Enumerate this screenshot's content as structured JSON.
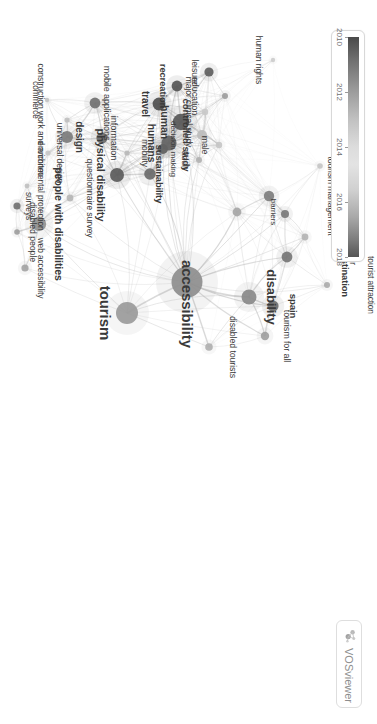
{
  "app": {
    "name": "VOSviewer",
    "brand_label": "VOSviewer",
    "canvas_background": "#ffffff"
  },
  "legend": {
    "type": "continuous-color-scale",
    "variable": "avg. publication year",
    "min": 2010,
    "max": 2018,
    "ticks": [
      {
        "label": "2010",
        "value": 2010
      },
      {
        "label": "2012",
        "value": 2012
      },
      {
        "label": "2014",
        "value": 2014
      },
      {
        "label": "2016",
        "value": 2016
      },
      {
        "label": "2018",
        "value": 2018
      }
    ],
    "colors": [
      "#4a4a4a",
      "#9a9a9a",
      "#e3e3e3",
      "#a8a8a8",
      "#555555"
    ]
  },
  "chart_data": {
    "type": "scatter",
    "title": "",
    "xlabel": "",
    "ylabel": "",
    "colorbar": {
      "min": 2010,
      "max": 2018,
      "ticks": [
        2010,
        2012,
        2014,
        2016,
        2018
      ]
    },
    "nodes": [
      {
        "label": "accessibility",
        "x": 282,
        "y": 190,
        "r": 15.5,
        "year": 2014.4,
        "color": "#8e8e8e"
      },
      {
        "label": "tourism",
        "x": 313,
        "y": 250,
        "r": 11.0,
        "year": 2014.8,
        "color": "#9a9a9a"
      },
      {
        "label": "disability",
        "x": 297,
        "y": 128,
        "r": 7.5,
        "year": 2014.0,
        "color": "#8a8a8a"
      },
      {
        "label": "tourism management",
        "x": 196,
        "y": 108,
        "r": 5.2,
        "year": 2013.4,
        "color": "#7e7e7e"
      },
      {
        "label": "hospitality industry",
        "x": 214,
        "y": 92,
        "r": 4.0,
        "year": 2013.0,
        "color": "#7a7a7a"
      },
      {
        "label": "tourist destination",
        "x": 257,
        "y": 90,
        "r": 5.4,
        "year": 2013.2,
        "color": "#767676"
      },
      {
        "label": "tourist behavior",
        "x": 237,
        "y": 72,
        "r": 3.4,
        "year": 2013.8,
        "color": "#b4b4b4"
      },
      {
        "label": "tourist attraction",
        "x": 285,
        "y": 50,
        "r": 3.0,
        "year": 2013.6,
        "color": "#ababab"
      },
      {
        "label": "internet",
        "x": 166,
        "y": 57,
        "r": 2.8,
        "year": 2011.0,
        "color": "#c6c6c6"
      },
      {
        "label": "barriers",
        "x": 212,
        "y": 140,
        "r": 4.4,
        "year": 2014.6,
        "color": "#a6a6a6"
      },
      {
        "label": "spain",
        "x": 306,
        "y": 104,
        "r": 5.6,
        "year": 2013.0,
        "color": "#6f6f6f"
      },
      {
        "label": "tourism for all",
        "x": 336,
        "y": 112,
        "r": 4.2,
        "year": 2014.0,
        "color": "#a0a0a0"
      },
      {
        "label": "disabled tourists",
        "x": 347,
        "y": 168,
        "r": 3.8,
        "year": 2015.2,
        "color": "#b0b0b0"
      },
      {
        "label": "decision making",
        "x": 149,
        "y": 214,
        "r": 5.0,
        "year": 2011.8,
        "color": "#5f5f5f"
      },
      {
        "label": "sustainability",
        "x": 174,
        "y": 227,
        "r": 5.8,
        "year": 2016.6,
        "color": "#6a6a6a"
      },
      {
        "label": "mobility",
        "x": 153,
        "y": 250,
        "r": 2.6,
        "year": 2015.0,
        "color": "#b8b8b8"
      },
      {
        "label": "questionnaire survey",
        "x": 198,
        "y": 307,
        "r": 3.4,
        "year": 2012.4,
        "color": "#b6b6b6"
      },
      {
        "label": "people with disabilities",
        "x": 224,
        "y": 338,
        "r": 7.2,
        "year": 2013.6,
        "color": "#909090"
      },
      {
        "label": "web accessibility",
        "x": 268,
        "y": 352,
        "r": 3.6,
        "year": 2012.6,
        "color": "#a4a4a4"
      },
      {
        "label": "disabled people",
        "x": 232,
        "y": 360,
        "r": 2.8,
        "year": 2012.0,
        "color": "#9e9e9e"
      },
      {
        "label": "surveys",
        "x": 206,
        "y": 360,
        "r": 3.6,
        "year": 2011.4,
        "color": "#727272"
      },
      {
        "label": "environmental protection",
        "x": 186,
        "y": 350,
        "r": 2.4,
        "year": 2011.0,
        "color": "#c0c0c0"
      },
      {
        "label": "universal design",
        "x": 153,
        "y": 329,
        "r": 2.6,
        "year": 2012.8,
        "color": "#c8c8c8"
      },
      {
        "label": "design",
        "x": 137,
        "y": 310,
        "r": 6.0,
        "year": 2013.0,
        "color": "#7c7c7c"
      },
      {
        "label": "information",
        "x": 138,
        "y": 275,
        "r": 5.6,
        "year": 2012.6,
        "color": "#6b6b6b"
      },
      {
        "label": "mobile applications",
        "x": 103,
        "y": 282,
        "r": 5.4,
        "year": 2015.8,
        "color": "#717171"
      },
      {
        "label": "construction work and architec",
        "x": 120,
        "y": 310,
        "r": 2.6,
        "year": 2012.0,
        "color": "#bfbfbf"
      },
      {
        "label": "commerce",
        "x": 100,
        "y": 330,
        "r": 2.2,
        "year": 2012.2,
        "color": "#c4c4c4"
      },
      {
        "label": "physical disability",
        "x": 175,
        "y": 260,
        "r": 7.0,
        "year": 2012.4,
        "color": "#5b5b5b"
      },
      {
        "label": "humans",
        "x": 143,
        "y": 208,
        "r": 7.6,
        "year": 2011.4,
        "color": "#636363"
      },
      {
        "label": "human",
        "x": 122,
        "y": 196,
        "r": 8.2,
        "year": 2011.6,
        "color": "#585858"
      },
      {
        "label": "controlled study",
        "x": 135,
        "y": 175,
        "r": 5.0,
        "year": 2011.2,
        "color": "#bdbdbd"
      },
      {
        "label": "major clinical study",
        "x": 112,
        "y": 172,
        "r": 3.2,
        "year": 2011.0,
        "color": "#c9c9c9"
      },
      {
        "label": "adult",
        "x": 160,
        "y": 178,
        "r": 3.0,
        "year": 2011.2,
        "color": "#b2b2b2"
      },
      {
        "label": "male",
        "x": 145,
        "y": 158,
        "r": 3.2,
        "year": 2011.0,
        "color": "#c5c5c5"
      },
      {
        "label": "travel",
        "x": 104,
        "y": 218,
        "r": 6.4,
        "year": 2011.8,
        "color": "#4f4f4f"
      },
      {
        "label": "recreation",
        "x": 86,
        "y": 200,
        "r": 5.4,
        "year": 2011.6,
        "color": "#565656"
      },
      {
        "label": "leisure",
        "x": 72,
        "y": 168,
        "r": 4.6,
        "year": 2011.4,
        "color": "#5e5e5e"
      },
      {
        "label": "education",
        "x": 96,
        "y": 152,
        "r": 3.0,
        "year": 2012.6,
        "color": "#9d9d9d"
      },
      {
        "label": "human rights",
        "x": 60,
        "y": 104,
        "r": 2.2,
        "year": 2013.2,
        "color": "#cdcdcd"
      }
    ]
  },
  "network": {
    "labels": [
      {
        "text": "accessibility",
        "x": 282,
        "y": 190,
        "size": 15.0,
        "weight": "bold",
        "dx": 22,
        "dy": 0
      },
      {
        "text": "tourism",
        "x": 313,
        "y": 250,
        "size": 15.0,
        "weight": "bold",
        "dx": 0,
        "dy": 22
      },
      {
        "text": "disability",
        "x": 297,
        "y": 128,
        "size": 13.0,
        "weight": "bold",
        "dx": 0,
        "dy": -22
      },
      {
        "text": "tourism management",
        "x": 196,
        "y": 108,
        "size": 8.6,
        "weight": "normal",
        "dx": 0,
        "dy": -62
      },
      {
        "text": "hospitality industry",
        "x": 214,
        "y": 92,
        "size": 8.6,
        "weight": "normal",
        "dx": 0,
        "dy": -55
      },
      {
        "text": "tourist destination",
        "x": 257,
        "y": 90,
        "size": 9.4,
        "weight": "bold",
        "dx": 0,
        "dy": -58
      },
      {
        "text": "tourist behavior",
        "x": 237,
        "y": 72,
        "size": 8.4,
        "weight": "normal",
        "dx": 0,
        "dy": -48
      },
      {
        "text": "tourist attraction",
        "x": 285,
        "y": 50,
        "size": 8.4,
        "weight": "normal",
        "dx": 0,
        "dy": -44
      },
      {
        "text": "internet",
        "x": 166,
        "y": 57,
        "size": 7.8,
        "weight": "normal",
        "dx": 0,
        "dy": -38
      },
      {
        "text": "barriers",
        "x": 212,
        "y": 140,
        "size": 8.0,
        "weight": "normal",
        "dx": 0,
        "dy": -36
      },
      {
        "text": "spain",
        "x": 306,
        "y": 104,
        "size": 9.6,
        "weight": "bold",
        "dx": 0,
        "dy": -20
      },
      {
        "text": "tourism for all",
        "x": 336,
        "y": 112,
        "size": 9.0,
        "weight": "normal",
        "dx": 0,
        "dy": -22
      },
      {
        "text": "disabled tourists",
        "x": 347,
        "y": 168,
        "size": 8.8,
        "weight": "normal",
        "dx": 0,
        "dy": -24
      },
      {
        "text": "decision making",
        "x": 149,
        "y": 214,
        "size": 8.0,
        "weight": "normal",
        "dx": 0,
        "dy": -10
      },
      {
        "text": "sustainability",
        "x": 174,
        "y": 227,
        "size": 9.4,
        "weight": "bold",
        "dx": 0,
        "dy": -9
      },
      {
        "text": "mobility",
        "x": 153,
        "y": 250,
        "size": 8.4,
        "weight": "normal",
        "dx": 0,
        "dy": -18
      },
      {
        "text": "questionnaire survey",
        "x": 198,
        "y": 307,
        "size": 8.8,
        "weight": "normal",
        "dx": 0,
        "dy": -20
      },
      {
        "text": "people with disabilities",
        "x": 224,
        "y": 338,
        "size": 10.6,
        "weight": "bold",
        "dx": 0,
        "dy": -20
      },
      {
        "text": "web accessibility",
        "x": 268,
        "y": 352,
        "size": 8.4,
        "weight": "normal",
        "dx": 0,
        "dy": -16
      },
      {
        "text": "disabled people",
        "x": 232,
        "y": 360,
        "size": 8.8,
        "weight": "normal",
        "dx": 0,
        "dy": -16
      },
      {
        "text": "surveys",
        "x": 206,
        "y": 360,
        "size": 8.4,
        "weight": "normal",
        "dx": 0,
        "dy": -12
      },
      {
        "text": "environmental protection",
        "x": 186,
        "y": 350,
        "size": 8.4,
        "weight": "normal",
        "dx": 0,
        "dy": -14
      },
      {
        "text": "universal design",
        "x": 153,
        "y": 329,
        "size": 8.6,
        "weight": "normal",
        "dx": 0,
        "dy": -12
      },
      {
        "text": "design",
        "x": 137,
        "y": 310,
        "size": 10.0,
        "weight": "bold",
        "dx": 0,
        "dy": -12
      },
      {
        "text": "information",
        "x": 138,
        "y": 275,
        "size": 9.2,
        "weight": "normal",
        "dx": 0,
        "dy": -12
      },
      {
        "text": "mobile applications",
        "x": 103,
        "y": 282,
        "size": 9.0,
        "weight": "normal",
        "dx": 0,
        "dy": -12
      },
      {
        "text": "construction work and architec",
        "x": 120,
        "y": 310,
        "size": 8.6,
        "weight": "normal",
        "dx": 0,
        "dy": 26
      },
      {
        "text": "commerce",
        "x": 100,
        "y": 330,
        "size": 8.2,
        "weight": "normal",
        "dx": 0,
        "dy": 12
      },
      {
        "text": "physical disability",
        "x": 175,
        "y": 260,
        "size": 11.0,
        "weight": "bold",
        "dx": 0,
        "dy": 16
      },
      {
        "text": "humans",
        "x": 143,
        "y": 208,
        "size": 10.2,
        "weight": "bold",
        "dx": 0,
        "dy": 18
      },
      {
        "text": "human",
        "x": 122,
        "y": 196,
        "size": 10.6,
        "weight": "bold",
        "dx": 0,
        "dy": 16
      },
      {
        "text": "controlled study",
        "x": 135,
        "y": 175,
        "size": 9.6,
        "weight": "bold",
        "dx": 0,
        "dy": 16
      },
      {
        "text": "major clinical study",
        "x": 112,
        "y": 172,
        "size": 8.6,
        "weight": "normal",
        "dx": 0,
        "dy": 16
      },
      {
        "text": "adult",
        "x": 160,
        "y": 178,
        "size": 8.8,
        "weight": "normal",
        "dx": 0,
        "dy": 14
      },
      {
        "text": "male",
        "x": 145,
        "y": 158,
        "size": 8.8,
        "weight": "normal",
        "dx": 0,
        "dy": 14
      },
      {
        "text": "travel",
        "x": 104,
        "y": 218,
        "size": 10.0,
        "weight": "bold",
        "dx": 0,
        "dy": 14
      },
      {
        "text": "recreation",
        "x": 86,
        "y": 200,
        "size": 9.4,
        "weight": "bold",
        "dx": 0,
        "dy": 14
      },
      {
        "text": "leisure",
        "x": 72,
        "y": 168,
        "size": 8.8,
        "weight": "normal",
        "dx": 0,
        "dy": 14
      },
      {
        "text": "education",
        "x": 96,
        "y": 152,
        "size": 9.0,
        "weight": "normal",
        "dx": 0,
        "dy": 30
      },
      {
        "text": "human rights",
        "x": 60,
        "y": 104,
        "size": 8.6,
        "weight": "normal",
        "dx": 0,
        "dy": 14
      }
    ]
  }
}
